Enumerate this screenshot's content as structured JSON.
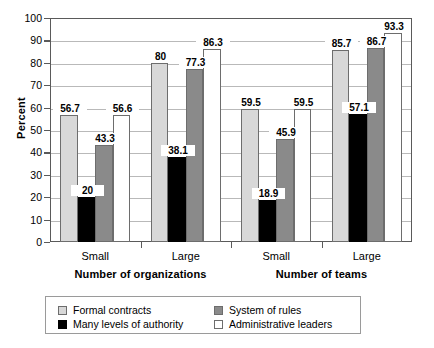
{
  "chart_data": {
    "type": "bar",
    "title": "",
    "subtitle": "",
    "xlabel": "",
    "ylabel": "Percent",
    "ylim": [
      0,
      100
    ],
    "ytick_step": 10,
    "yticks": [
      0,
      10,
      20,
      30,
      40,
      50,
      60,
      70,
      80,
      90,
      100
    ],
    "ytick_labels": [
      "0",
      "10",
      "20",
      "30",
      "40",
      "50",
      "60",
      "70",
      "80",
      "90",
      "100"
    ],
    "grid": true,
    "grid_axis": "y",
    "legend_position": "bottom",
    "categories": [
      "Small",
      "Large",
      "Small",
      "Large"
    ],
    "category_groups": [
      {
        "label": "Number of organizations",
        "categories": [
          "Small",
          "Large"
        ]
      },
      {
        "label": "Number of teams",
        "categories": [
          "Small",
          "Large"
        ]
      }
    ],
    "series": [
      {
        "name": "Formal contracts",
        "color": "#d8d8d8",
        "values": [
          56.7,
          80,
          59.5,
          85.7
        ],
        "labels": [
          "56.7",
          "80",
          "59.5",
          "85.7"
        ]
      },
      {
        "name": "Many levels of authority",
        "color": "#000000",
        "values": [
          20,
          38.1,
          18.9,
          57.1
        ],
        "labels": [
          "20",
          "38.1",
          "18.9",
          "57.1"
        ]
      },
      {
        "name": "System of rules",
        "color": "#8a8a8a",
        "values": [
          43.3,
          77.3,
          45.9,
          86.7
        ],
        "labels": [
          "43.3",
          "77.3",
          "45.9",
          "86.7"
        ]
      },
      {
        "name": "Administrative leaders",
        "color": "#ffffff",
        "values": [
          56.6,
          86.3,
          59.5,
          93.3
        ],
        "labels": [
          "56.6",
          "86.3",
          "59.5",
          "93.3"
        ]
      }
    ]
  },
  "axis": {
    "y_title": "Percent"
  },
  "group_labels": {
    "g0": "Small",
    "g1": "Large",
    "g2": "Small",
    "g3": "Large"
  },
  "super_labels": {
    "left": "Number of organizations",
    "right": "Number of teams"
  },
  "legend": {
    "items": [
      {
        "label": "Formal contracts",
        "swatch": "light-gray"
      },
      {
        "label": "System of rules",
        "swatch": "mid-gray"
      },
      {
        "label": "Many levels of authority",
        "swatch": "black"
      },
      {
        "label": "Administrative leaders",
        "swatch": "white"
      }
    ]
  }
}
